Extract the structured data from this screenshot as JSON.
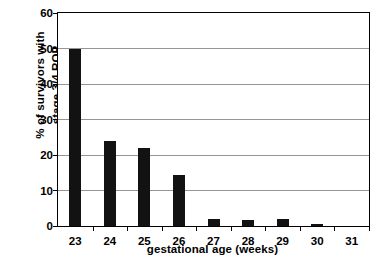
{
  "chart_data": {
    "type": "bar",
    "title": "",
    "xlabel": "gestational age (weeks)",
    "ylabel_lines": [
      "% of survivors with",
      "stage 3/4 ROP"
    ],
    "ylabel": "% of survivors with stage 3/4 ROP",
    "categories": [
      "23",
      "24",
      "25",
      "26",
      "27",
      "28",
      "29",
      "30",
      "31"
    ],
    "values": [
      50,
      24,
      22,
      14.4,
      2.1,
      1.7,
      2.1,
      0.6,
      0
    ],
    "ylim": [
      0,
      60
    ],
    "ytick_labels": [
      "0",
      "10",
      "20",
      "30",
      "40",
      "50",
      "60"
    ],
    "ytick_values": [
      0,
      10,
      20,
      30,
      40,
      50,
      60
    ],
    "grid": "horizontal",
    "legend": "none",
    "bar_color": "#121212",
    "gridline_color": "#959595",
    "axis_color": "#000000",
    "background_color": "#ffffff"
  }
}
